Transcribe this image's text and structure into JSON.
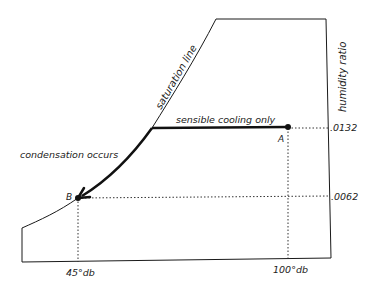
{
  "diagram": {
    "type": "psychrometric-process",
    "labels": {
      "saturation_line": "saturation line",
      "humidity_ratio": "humidity ratio",
      "sensible_cooling": "sensible cooling only",
      "condensation": "condensation occurs",
      "point_a": "A",
      "point_b": "B",
      "hr_a": ".0132",
      "hr_b": ".0062",
      "db_b": "45°db",
      "db_a": "100°db"
    },
    "colors": {
      "line": "#1a1a1a",
      "text": "#222222"
    }
  }
}
